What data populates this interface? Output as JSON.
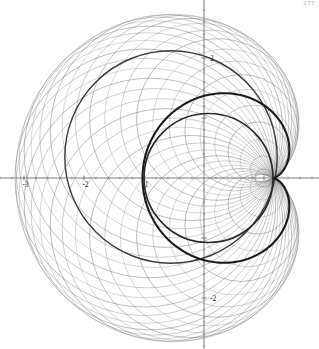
{
  "figure": {
    "kind": "envelope-of-circle-family",
    "caption_visible": false,
    "page_number": "277",
    "background_color": "#ffffff"
  },
  "axes": {
    "origin_px": [
      204,
      178
    ],
    "pixels_per_unit": 60,
    "x_range": [
      -3.4,
      1.92
    ],
    "y_range": [
      -2.85,
      2.97
    ],
    "axis_color": "#6e6e6e",
    "axis_line_width": 0.9,
    "major_tick_length": 5,
    "minor_tick_length": 2.5,
    "minor_ticks_per_unit": 5,
    "x_labels": [
      {
        "value": -3,
        "text": "-3"
      },
      {
        "value": -2,
        "text": "-2"
      },
      {
        "value": -1,
        "text": "-1"
      }
    ],
    "y_labels": [
      {
        "value": 2,
        "text": "2"
      },
      {
        "value": -2,
        "text": "-2"
      }
    ],
    "label_color": "#2b2b2b",
    "label_font_size": 7.5
  },
  "chart_data": {
    "type": "line",
    "title": "",
    "subtitle": "",
    "xlabel": "",
    "ylabel": "",
    "grid": false,
    "legend": "none",
    "xlim": [
      -3.4,
      1.92
    ],
    "ylim": [
      -2.85,
      2.97
    ],
    "series": [
      {
        "name": "circle-family",
        "kind": "circles",
        "count": 42,
        "color": "#7d7d7d",
        "line_width": 0.55,
        "opacity": 0.8,
        "generator": {
          "description": "Circle k is centered at (cos t, sin t) with radius |P - center| where P is the cusp point; t sweeps 0..2pi.",
          "center_path_radius": 1.0,
          "center_path_center": [
            0,
            0
          ],
          "through_point": [
            1.15,
            0
          ],
          "t_start_deg": 0,
          "t_end_deg": 360
        }
      },
      {
        "name": "envelope-cardioid-outer",
        "kind": "cardioid",
        "color": "#1b1b1b",
        "line_width": 2.1,
        "opacity": 1,
        "cusp": [
          1.15,
          0
        ],
        "a": 1.0875,
        "description": "Outer dark envelope lobe: r = a(1 + cos theta) measured from the cusp, opening toward negative x, reaching x = -3.2."
      },
      {
        "name": "envelope-cardioid-inner",
        "kind": "cardioid-inner",
        "color": "#2a2a2a",
        "line_width": 1.7,
        "opacity": 1,
        "cusp": [
          1.15,
          0
        ],
        "description": "Inner dark envelope loop tangent to the x-axis near x = -1 and passing back to the cusp."
      },
      {
        "name": "secondary-dark-circle",
        "kind": "circle",
        "color": "#3a3a3a",
        "line_width": 1.4,
        "center": [
          -0.55,
          0.35
        ],
        "radius": 1.77,
        "description": "One member of the family drawn darker than the rest."
      }
    ],
    "annotations": []
  },
  "tooltip": {
    "text": ""
  }
}
